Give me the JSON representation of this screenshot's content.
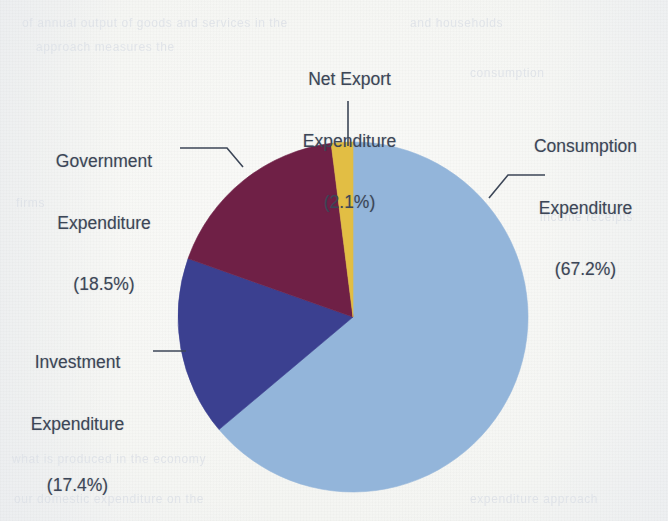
{
  "page": {
    "background_color": "#f4f5f2",
    "text_color": "#3c4657",
    "ghost_text": [
      "of annual output of goods and services in the",
      "and households",
      "approach measures the",
      "consumption",
      "firms",
      "income receipts",
      "what is produced in the economy",
      "our domestic expenditure on the",
      "expenditure approach"
    ]
  },
  "chart_data": {
    "type": "pie",
    "title": "",
    "categories": [
      "Consumption Expenditure",
      "Investment Expenditure",
      "Government Expenditure",
      "Net Export Expenditure"
    ],
    "values": [
      67.2,
      17.4,
      18.5,
      2.1
    ],
    "value_unit": "%",
    "colors": [
      "#93b5da",
      "#3b4090",
      "#6f2046",
      "#e2be44"
    ],
    "start_angle_deg": 0,
    "direction": "clockwise",
    "legend": "none",
    "labels_outside": true,
    "leader_lines": true,
    "center_px": {
      "x": 353,
      "y": 317
    },
    "radius_px": 175,
    "slices": [
      {
        "name": "Consumption Expenditure",
        "value": 67.2,
        "color": "#93b5da",
        "label_line1": "Consumption",
        "label_line2": "Expenditure",
        "label_line3": "(67.2%)"
      },
      {
        "name": "Investment Expenditure",
        "value": 17.4,
        "color": "#3b4090",
        "label_line1": "Investment",
        "label_line2": "Expenditure",
        "label_line3": "(17.4%)"
      },
      {
        "name": "Government Expenditure",
        "value": 18.5,
        "color": "#6f2046",
        "label_line1": "Government",
        "label_line2": "Expenditure",
        "label_line3": "(18.5%)"
      },
      {
        "name": "Net Export Expenditure",
        "value": 2.1,
        "color": "#e2be44",
        "label_line1": "Net Export",
        "label_line2": "Expenditure",
        "label_line3": "(2.1%)"
      }
    ]
  }
}
